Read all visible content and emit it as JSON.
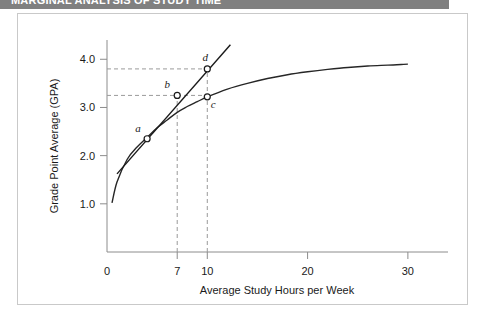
{
  "header": {
    "title": "MARGINAL ANALYSIS OF STUDY TIME",
    "bar_color": "#808080"
  },
  "figure": {
    "border_color": "#c9c9c9",
    "background": "#ffffff"
  },
  "chart_data": {
    "type": "line",
    "title": "",
    "xlabel": "Average Study Hours per Week",
    "ylabel": "Grade Point Average (GPA)",
    "xlim": [
      0,
      34
    ],
    "ylim": [
      0,
      4.4
    ],
    "grid": false,
    "legend_position": "none",
    "xticks": [
      0,
      7,
      10,
      20,
      30
    ],
    "xtick_labels": [
      "0",
      "7",
      "10",
      "20",
      "30"
    ],
    "yticks": [
      1.0,
      2.0,
      3.0,
      4.0
    ],
    "ytick_labels": [
      "1.0",
      "2.0",
      "3.0",
      "4.0"
    ],
    "series": [
      {
        "name": "Total grade curve",
        "kind": "curve",
        "style": "solid",
        "color": "#262626",
        "x": [
          0.5,
          1,
          2,
          3,
          4,
          5,
          6,
          7,
          8,
          9,
          10,
          12,
          14,
          16,
          18,
          20,
          22,
          24,
          26,
          28,
          30
        ],
        "y": [
          1.02,
          1.45,
          1.92,
          2.18,
          2.38,
          2.58,
          2.74,
          2.9,
          3.02,
          3.12,
          3.22,
          3.38,
          3.5,
          3.6,
          3.68,
          3.74,
          3.79,
          3.83,
          3.86,
          3.88,
          3.9
        ]
      },
      {
        "name": "Secant / marginal line through a, b, d",
        "kind": "straight",
        "style": "solid",
        "color": "#1a1a1a",
        "x": [
          1.0,
          12.3
        ],
        "y": [
          1.62,
          4.3
        ]
      }
    ],
    "points": [
      {
        "label": "a",
        "x": 4.0,
        "y": 2.35,
        "label_dx": -9,
        "label_dy": -7
      },
      {
        "label": "b",
        "x": 7.0,
        "y": 3.25,
        "label_dx": -10,
        "label_dy": -7
      },
      {
        "label": "c",
        "x": 10.0,
        "y": 3.22,
        "label_dx": 6,
        "label_dy": 11
      },
      {
        "label": "d",
        "x": 10.0,
        "y": 3.8,
        "label_dx": -2,
        "label_dy": -8
      }
    ],
    "guides": [
      {
        "orientation": "horizontal",
        "value": 3.8,
        "from": 0,
        "to": 10,
        "style": "dashed"
      },
      {
        "orientation": "horizontal",
        "value": 3.25,
        "from": 0,
        "to": 10,
        "style": "dashed"
      },
      {
        "orientation": "vertical",
        "value": 7.0,
        "from": 0,
        "to": 3.25,
        "style": "dashed"
      },
      {
        "orientation": "vertical",
        "value": 10.0,
        "from": 0,
        "to": 3.8,
        "style": "dashed"
      }
    ],
    "annotations": []
  }
}
